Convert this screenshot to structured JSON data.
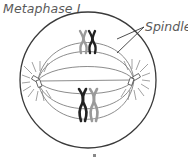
{
  "diagram": {
    "title": "Metaphase I",
    "labels": {
      "spindle": "Spindle"
    },
    "structures": {
      "cell_membrane": {
        "shape": "circle",
        "cx": 88,
        "cy": 80,
        "r": 68
      },
      "centrosomes": [
        {
          "side": "left",
          "x": 38,
          "y": 82
        },
        {
          "side": "right",
          "x": 134,
          "y": 80
        }
      ],
      "chromosome_pairs": [
        {
          "position": "top",
          "x": 87,
          "y": 42,
          "homologs": [
            "grey",
            "dark"
          ]
        },
        {
          "position": "bottom",
          "x": 88,
          "y": 105,
          "homologs": [
            "dark",
            "grey"
          ]
        }
      ],
      "metaphase_plate": "vertical, center of cell"
    },
    "colors": {
      "outline": "#3a3a3a",
      "spindle_fiber": "#6e6e6e",
      "chromosome_dark": "#222222",
      "chromosome_grey": "#9a9a9a",
      "label_text": "#5a5a5a"
    }
  }
}
